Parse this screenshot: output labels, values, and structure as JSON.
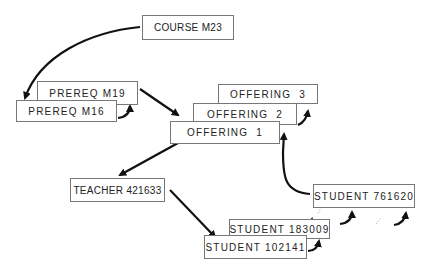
{
  "diagram": {
    "nodes": {
      "course": "COURSE M23",
      "prereq_m19": "PREREQ M19",
      "prereq_m16": "PREREQ M16",
      "offering_3": "OFFERING  3",
      "offering_2": "OFFERING  2",
      "offering_1": "OFFERING  1",
      "teacher": "TEACHER 421633",
      "student_761620": "STUDENT 761620",
      "student_183009": "STUDENT 183009",
      "student_102141": "STUDENT 102141"
    },
    "edges": [
      {
        "from": "course",
        "to": "prereq_m16"
      },
      {
        "from": "prereq_m19",
        "to": "offering_1"
      },
      {
        "from": "offering_1",
        "to": "teacher"
      },
      {
        "from": "teacher",
        "to": "student_102141"
      },
      {
        "from": "student_761620",
        "to": "offering_2"
      }
    ]
  }
}
